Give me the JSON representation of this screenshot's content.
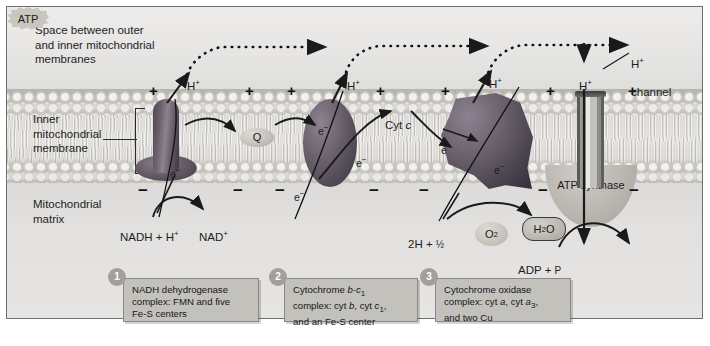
{
  "figure": {
    "type": "biology-diagram"
  },
  "regions": {
    "intermembrane_space_label": "Space between outer\nand inner mitochondrial\nmembranes",
    "inner_membrane_label": "Inner\nmitochondrial\nmembrane",
    "matrix_label": "Mitochondrial\nmatrix"
  },
  "charges": {
    "positive_symbol": "+",
    "negative_symbol": "−",
    "positive_positions": [
      148,
      244,
      286,
      375,
      440,
      545,
      627
    ],
    "negative_positions": [
      137,
      232,
      274,
      368,
      418,
      537,
      628
    ]
  },
  "proton_labels": [
    {
      "text": "H",
      "sup": "+",
      "x": 186,
      "y": 62
    },
    {
      "text": "H",
      "sup": "+",
      "x": 346,
      "y": 62
    },
    {
      "text": "H",
      "sup": "+",
      "x": 488,
      "y": 60
    },
    {
      "text": "H",
      "sup": "+",
      "x": 578,
      "y": 62
    }
  ],
  "channel": {
    "label_line1": "H",
    "label_sup": "+",
    "label_line2": "channel",
    "x": 611,
    "y": 42
  },
  "carriers": {
    "q": "Q",
    "cyt_c_prefix": "Cyt ",
    "cyt_c_italic": "c"
  },
  "electron_labels": [
    {
      "text": "e",
      "sup": "−",
      "x": 166,
      "y": 150
    },
    {
      "text": "e",
      "sup": "−",
      "x": 313,
      "y": 106
    },
    {
      "text": "e",
      "sup": "−",
      "x": 348,
      "y": 139
    },
    {
      "text": "e",
      "sup": "−",
      "x": 291,
      "y": 173
    },
    {
      "text": "e",
      "sup": "−",
      "x": 440,
      "y": 125
    },
    {
      "text": "e",
      "sup": "−",
      "x": 492,
      "y": 145
    }
  ],
  "reactions": {
    "nadh": "NADH + H",
    "nadh_sup": "+",
    "nad": "NAD",
    "nad_sup": "+",
    "two_h": "2H + ",
    "half": "½",
    "o2": "O",
    "o2_sub": "2",
    "h2o": "H",
    "h2o_sub": "2",
    "h2o_tail": "O",
    "adp": "ADP + ",
    "phosphate": "P",
    "atp": "ATP"
  },
  "atp_synthase": {
    "label": "ATP synthase"
  },
  "captions": [
    {
      "number": "1",
      "text": "NADH dehydrogenase complex: FMN and five Fe-S centers",
      "line1": "NADH dehydrogenase",
      "line2": "complex: FMN and five",
      "line3": "Fe-S centers"
    },
    {
      "number": "2",
      "text": "Cytochrome b-c1 complex: cyt b, cyt c1, and an Fe-S center",
      "line1_plain": "Cytochrome ",
      "line1_italic": "b-c",
      "line1_sub": "1",
      "line2_plain": "complex: cyt ",
      "line2_italic1": "b",
      "line2_mid": ", cyt ",
      "line2_italic2": "c",
      "line2_sub": "1",
      "line2_end": ",",
      "line3": "and an Fe-S center"
    },
    {
      "number": "3",
      "text": "Cytochrome oxidase complex: cyt a, cyt a3, and two Cu",
      "line1": "Cytochrome oxidase",
      "line2_plain": "complex: cyt ",
      "line2_italic1": "a",
      "line2_mid": ", cyt ",
      "line2_italic2": "a",
      "line2_sub": "3",
      "line2_end": ",",
      "line3": "and two Cu"
    }
  ],
  "colors": {
    "background": "#e4e3e1",
    "frame_border": "#6f6f6f",
    "caption_fill": "#c3c1bc",
    "badge_fill": "#a3a09b",
    "protein_dark": "#4a4350",
    "membrane_band": "#d7d5d1",
    "text": "#1d1d1d"
  }
}
